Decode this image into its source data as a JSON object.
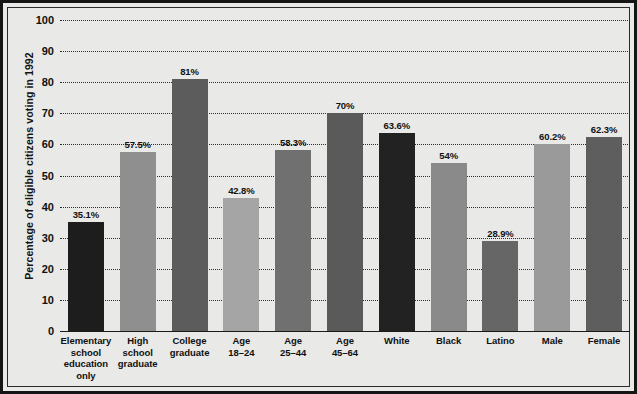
{
  "chart_data": {
    "type": "bar",
    "title": "",
    "xlabel": "",
    "ylabel": "Percentage of eligible citizens voting in 1992",
    "ylim": [
      0,
      100
    ],
    "grid": true,
    "legend_position": "none",
    "yticks": [
      "100",
      "90",
      "80",
      "70",
      "60",
      "50",
      "40",
      "30",
      "20",
      "10",
      "0"
    ],
    "ytick_values": [
      100,
      90,
      80,
      70,
      60,
      50,
      40,
      30,
      20,
      10,
      0
    ],
    "categories": [
      "Elementary school education only",
      "High school graduate",
      "College graduate",
      "Age 18–24",
      "Age 25–44",
      "Age 45–64",
      "White",
      "Black",
      "Latino",
      "Male",
      "Female"
    ],
    "category_lines": [
      [
        "Elementary",
        "school",
        "education",
        "only"
      ],
      [
        "High",
        "school",
        "graduate"
      ],
      [
        "College",
        "graduate"
      ],
      [
        "Age",
        "18–24"
      ],
      [
        "Age",
        "25–44"
      ],
      [
        "Age",
        "45–64"
      ],
      [
        "White"
      ],
      [
        "Black"
      ],
      [
        "Latino"
      ],
      [
        "Male"
      ],
      [
        "Female"
      ]
    ],
    "values": [
      35.1,
      57.5,
      81,
      42.8,
      58.3,
      70,
      63.6,
      54,
      28.9,
      60.2,
      62.3
    ],
    "value_labels": [
      "35.1%",
      "57.5%",
      "81%",
      "42.8%",
      "58.3%",
      "70%",
      "63.6%",
      "54%",
      "28.9%",
      "60.2%",
      "62.3%"
    ],
    "bar_colors": [
      "#1d1d1d",
      "#8f8f8f",
      "#5c5c5c",
      "#a5a5a5",
      "#707070",
      "#5a5a5a",
      "#222222",
      "#8a8a8a",
      "#666666",
      "#9a9a9a",
      "#5e5e5e"
    ],
    "plot_background": "#e9e9e7",
    "gridline_color": "#2d2d2d",
    "axis_color": "#1a1a1a",
    "frame_color": "#151515"
  }
}
